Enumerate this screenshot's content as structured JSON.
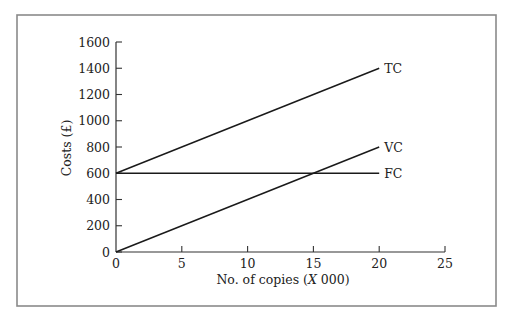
{
  "chart_data": {
    "type": "line",
    "title": "",
    "xlabel": "No. of copies (X 000)",
    "xlabel_parts": {
      "prefix": "No. of copies (",
      "italic": "X",
      "suffix": " 000)"
    },
    "ylabel": "Costs (£)",
    "xlim": [
      0,
      25
    ],
    "ylim": [
      0,
      1600
    ],
    "x_ticks": [
      0,
      5,
      10,
      15,
      20,
      25
    ],
    "y_ticks": [
      0,
      200,
      400,
      600,
      800,
      1000,
      1200,
      1400,
      1600
    ],
    "grid": false,
    "legend": "inline labels at line ends",
    "x": [
      0,
      20
    ],
    "series": [
      {
        "name": "TC",
        "values": [
          600,
          1400
        ]
      },
      {
        "name": "VC",
        "values": [
          0,
          800
        ]
      },
      {
        "name": "FC",
        "values": [
          600,
          600
        ]
      }
    ],
    "annotations": [
      "VC intersects FC at x = 15, y = 600"
    ]
  }
}
